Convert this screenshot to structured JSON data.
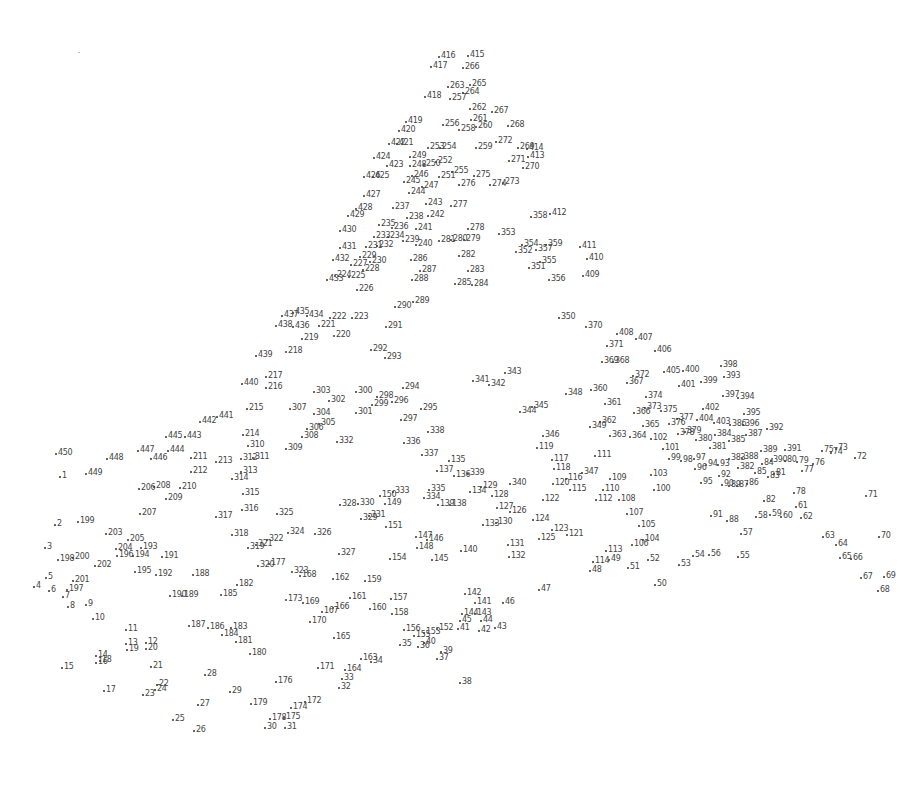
{
  "puzzle": {
    "type": "connect-the-dots",
    "ink_color": "#444444",
    "background": "#ffffff",
    "first_dot": "1",
    "last_dot": "450",
    "dots": [
      "1",
      "2",
      "3",
      "4",
      "5",
      "6",
      "7",
      "8",
      "9",
      "10",
      "11",
      "12",
      "13",
      "14",
      "15",
      "16",
      "17",
      "18",
      "19",
      "20",
      "21",
      "22",
      "23",
      "24",
      "25",
      "26",
      "27",
      "28",
      "29",
      "30",
      "31",
      "32",
      "33",
      "34",
      "35",
      "36",
      "37",
      "38",
      "39",
      "40",
      "41",
      "42",
      "43",
      "44",
      "45",
      "46",
      "47",
      "48",
      "49",
      "50",
      "51",
      "52",
      "53",
      "54",
      "55",
      "56",
      "57",
      "58",
      "59",
      "60",
      "61",
      "62",
      "63",
      "64",
      "65",
      "66",
      "67",
      "68",
      "69",
      "70",
      "71",
      "72",
      "73",
      "74",
      "75",
      "76",
      "77",
      "78",
      "79",
      "80",
      "81",
      "82",
      "83",
      "84",
      "85",
      "86",
      "87",
      "88",
      "89",
      "90",
      "91",
      "92",
      "93",
      "94",
      "95",
      "96",
      "97",
      "98",
      "99",
      "100",
      "101",
      "102",
      "103",
      "104",
      "105",
      "106",
      "107",
      "108",
      "109",
      "110",
      "111",
      "112",
      "113",
      "114",
      "115",
      "116",
      "117",
      "118",
      "119",
      "120",
      "121",
      "122",
      "123",
      "124",
      "125",
      "126",
      "127",
      "128",
      "129",
      "130",
      "131",
      "132",
      "133",
      "134",
      "135",
      "136",
      "137",
      "138",
      "139",
      "140",
      "141",
      "142",
      "143",
      "144",
      "145",
      "146",
      "147",
      "148",
      "149",
      "150",
      "151",
      "152",
      "153",
      "154",
      "155",
      "156",
      "157",
      "158",
      "159",
      "160",
      "161",
      "162",
      "163",
      "164",
      "165",
      "166",
      "167",
      "168",
      "169",
      "170",
      "171",
      "172",
      "173",
      "174",
      "175",
      "176",
      "177",
      "178",
      "179",
      "180",
      "181",
      "182",
      "183",
      "184",
      "185",
      "186",
      "187",
      "188",
      "189",
      "190",
      "191",
      "192",
      "193",
      "194",
      "195",
      "196",
      "197",
      "198",
      "199",
      "200",
      "201",
      "202",
      "203",
      "204",
      "205",
      "206",
      "207",
      "208",
      "209",
      "210",
      "211",
      "212",
      "213",
      "214",
      "215",
      "216",
      "217",
      "218",
      "219",
      "220",
      "221",
      "222",
      "223",
      "224",
      "225",
      "226",
      "227",
      "228",
      "229",
      "230",
      "231",
      "232",
      "233",
      "234",
      "235",
      "236",
      "237",
      "238",
      "239",
      "240",
      "241",
      "242",
      "243",
      "244",
      "245",
      "246",
      "247",
      "248",
      "249",
      "250",
      "251",
      "252",
      "253",
      "254",
      "255",
      "256",
      "257",
      "258",
      "259",
      "260",
      "261",
      "262",
      "263",
      "264",
      "265",
      "266",
      "267",
      "268",
      "269",
      "270",
      "271",
      "272",
      "273",
      "274",
      "275",
      "276",
      "277",
      "278",
      "279",
      "280",
      "281",
      "282",
      "283",
      "284",
      "285",
      "286",
      "287",
      "288",
      "289",
      "290",
      "291",
      "292",
      "293",
      "294",
      "295",
      "296",
      "297",
      "298",
      "299",
      "300",
      "301",
      "302",
      "303",
      "304",
      "305",
      "306",
      "307",
      "308",
      "309",
      "310",
      "311",
      "312",
      "313",
      "314",
      "315",
      "316",
      "317",
      "318",
      "319",
      "320",
      "321",
      "322",
      "323",
      "324",
      "325",
      "326",
      "327",
      "328",
      "329",
      "330",
      "331",
      "332",
      "333",
      "334",
      "335",
      "336",
      "337",
      "338",
      "339",
      "340",
      "341",
      "342",
      "343",
      "344",
      "345",
      "346",
      "347",
      "348",
      "349",
      "350",
      "351",
      "352",
      "353",
      "354",
      "355",
      "356",
      "357",
      "358",
      "359",
      "360",
      "361",
      "362",
      "363",
      "364",
      "365",
      "366",
      "367",
      "368",
      "369",
      "370",
      "371",
      "372",
      "373",
      "374",
      "375",
      "376",
      "377",
      "378",
      "379",
      "380",
      "381",
      "382",
      "383",
      "384",
      "385",
      "386",
      "387",
      "388",
      "389",
      "390",
      "391",
      "392",
      "393",
      "394",
      "395",
      "396",
      "397",
      "398",
      "399",
      "400",
      "401",
      "402",
      "403",
      "404",
      "405",
      "406",
      "407",
      "408",
      "409",
      "410",
      "411",
      "412",
      "413",
      "414",
      "415",
      "416",
      "417",
      "418",
      "419",
      "420",
      "421",
      "422",
      "423",
      "424",
      "425",
      "426",
      "427",
      "428",
      "429",
      "430",
      "431",
      "432",
      "433",
      "434",
      "435",
      "436",
      "437",
      "438",
      "439",
      "440",
      "441",
      "442",
      "443",
      "444",
      "445",
      "446",
      "447",
      "448",
      "449",
      "450"
    ]
  }
}
